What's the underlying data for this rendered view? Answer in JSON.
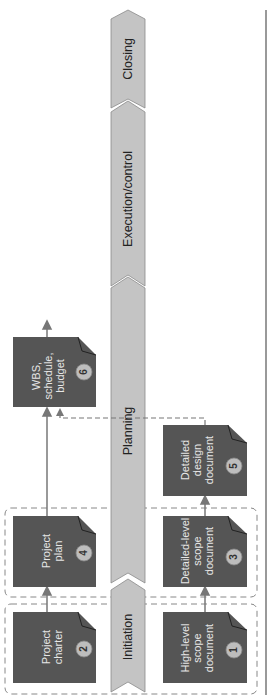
{
  "diagram": {
    "orientation": "rotated-90-ccw",
    "phases": [
      {
        "id": "initiation",
        "label": "Initiation"
      },
      {
        "id": "planning",
        "label": "Planning"
      },
      {
        "id": "execution",
        "label": "Execution/control"
      },
      {
        "id": "closing",
        "label": "Closing"
      }
    ],
    "documents": [
      {
        "num": "1",
        "label_lines": [
          "High-level",
          "scope",
          "document"
        ]
      },
      {
        "num": "2",
        "label_lines": [
          "Project",
          "charter"
        ]
      },
      {
        "num": "3",
        "label_lines": [
          "Detailed-level",
          "scope",
          "document"
        ]
      },
      {
        "num": "4",
        "label_lines": [
          "Project",
          "plan"
        ]
      },
      {
        "num": "5",
        "label_lines": [
          "Detailed",
          "design",
          "document"
        ]
      },
      {
        "num": "6",
        "label_lines": [
          "WBS,",
          "schedule,",
          "budget"
        ]
      }
    ],
    "colors": {
      "doc_fill": "#555555",
      "doc_text": "#e6e6e6",
      "badge_fill": "#bdbdbd",
      "phase_fill": "#c4c4c4",
      "phase_stroke": "#8a8a8a",
      "arrow": "#777777",
      "dashed": "#888888",
      "rule": "#555555"
    }
  }
}
